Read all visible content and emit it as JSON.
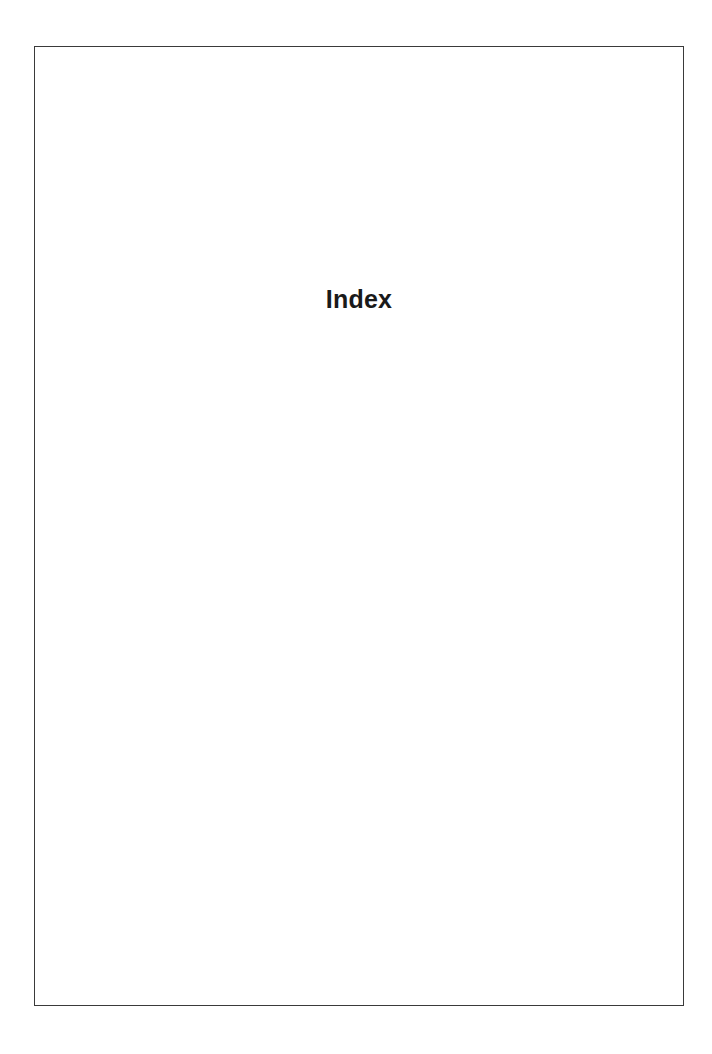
{
  "document": {
    "title": "Index"
  }
}
